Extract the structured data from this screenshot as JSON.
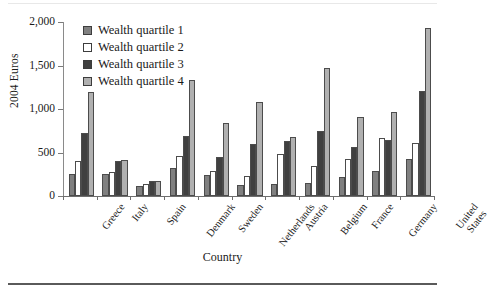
{
  "figure": {
    "xaxis_title": "Country",
    "yaxis_title": "2004 Euros"
  },
  "legend": {
    "items": [
      {
        "label": "Wealth quartile 1",
        "color": "#808080"
      },
      {
        "label": "Wealth quartile 2",
        "color": "#ffffff"
      },
      {
        "label": "Wealth quartile 3",
        "color": "#404040"
      },
      {
        "label": "Wealth quartile 4",
        "color": "#b0b0b0"
      }
    ]
  },
  "yticks": [
    {
      "value": 0,
      "label": "0"
    },
    {
      "value": 500,
      "label": "500"
    },
    {
      "value": 1000,
      "label": "1,000"
    },
    {
      "value": 1500,
      "label": "1,500"
    },
    {
      "value": 2000,
      "label": "2,000"
    }
  ],
  "chart_data": {
    "type": "bar",
    "title": "",
    "xlabel": "Country",
    "ylabel": "2004 Euros",
    "ylim": [
      0,
      2000
    ],
    "grid": false,
    "legend_position": "top-left-inside",
    "categories": [
      "Greece",
      "Italy",
      "Spain",
      "Denmark",
      "Sweden",
      "Netherlands",
      "Austria",
      "Belgium",
      "France",
      "Germany",
      "United States"
    ],
    "series": [
      {
        "name": "Wealth quartile 1",
        "color": "#808080",
        "values": [
          250,
          255,
          115,
          320,
          245,
          130,
          135,
          155,
          215,
          290,
          430
        ]
      },
      {
        "name": "Wealth quartile 2",
        "color": "#ffffff",
        "values": [
          400,
          275,
          140,
          460,
          285,
          230,
          480,
          350,
          430,
          670,
          610
        ]
      },
      {
        "name": "Wealth quartile 3",
        "color": "#404040",
        "values": [
          730,
          405,
          170,
          690,
          445,
          595,
          635,
          750,
          565,
          640,
          1210
        ]
      },
      {
        "name": "Wealth quartile 4",
        "color": "#b0b0b0",
        "values": [
          1190,
          415,
          170,
          1330,
          840,
          1075,
          675,
          1470,
          905,
          960,
          1930
        ]
      }
    ]
  }
}
